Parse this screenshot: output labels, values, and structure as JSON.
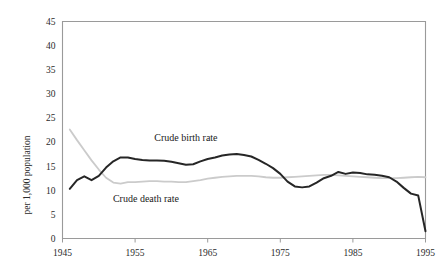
{
  "chart_data": {
    "type": "line",
    "title": "",
    "xlabel": "",
    "ylabel": "per 1,000 population",
    "xlim": [
      1945,
      1995
    ],
    "ylim": [
      0,
      45
    ],
    "ytick_labels": [
      "0",
      "5",
      "10",
      "15",
      "20",
      "25",
      "30",
      "35",
      "40",
      "45"
    ],
    "ytick_values": [
      0,
      5,
      10,
      15,
      20,
      25,
      30,
      35,
      40,
      45
    ],
    "xtick_labels": [
      "1945",
      "1955",
      "1965",
      "1975",
      "1985",
      "1995"
    ],
    "xtick_values": [
      1945,
      1955,
      1965,
      1975,
      1985,
      1995
    ],
    "grid": false,
    "legend_position": "inline-annotation",
    "annotations": [
      {
        "text": "Crude birth rate",
        "x": 1962,
        "y": 20.2
      },
      {
        "text": "Crude death rate",
        "x": 1956.5,
        "y": 7.6
      }
    ],
    "series": [
      {
        "name": "Crude birth rate",
        "color": "#262626",
        "width": 2.0,
        "x": [
          1946,
          1947,
          1948,
          1949,
          1950,
          1951,
          1952,
          1953,
          1954,
          1955,
          1956,
          1957,
          1958,
          1959,
          1960,
          1961,
          1962,
          1963,
          1964,
          1965,
          1966,
          1967,
          1968,
          1969,
          1970,
          1971,
          1972,
          1973,
          1974,
          1975,
          1976,
          1977,
          1978,
          1979,
          1980,
          1981,
          1982,
          1983,
          1984,
          1985,
          1986,
          1987,
          1988,
          1989,
          1990,
          1991,
          1992,
          1993,
          1994,
          1995
        ],
        "values": [
          10.3,
          12.1,
          12.9,
          12.1,
          13.0,
          14.7,
          16.0,
          16.8,
          16.8,
          16.5,
          16.3,
          16.2,
          16.2,
          16.1,
          15.9,
          15.6,
          15.3,
          15.4,
          16.0,
          16.5,
          16.8,
          17.2,
          17.4,
          17.5,
          17.3,
          17.0,
          16.3,
          15.5,
          14.6,
          13.4,
          11.8,
          10.8,
          10.6,
          10.8,
          11.6,
          12.5,
          13.0,
          13.8,
          13.4,
          13.7,
          13.6,
          13.3,
          13.2,
          13.0,
          12.7,
          11.8,
          10.5,
          9.3,
          8.9,
          1.5
        ]
      },
      {
        "name": "Crude death rate",
        "color": "#cbcbcb",
        "width": 1.8,
        "x": [
          1946,
          1947,
          1948,
          1949,
          1950,
          1951,
          1952,
          1953,
          1954,
          1955,
          1956,
          1957,
          1958,
          1959,
          1960,
          1961,
          1962,
          1963,
          1964,
          1965,
          1966,
          1967,
          1968,
          1969,
          1970,
          1971,
          1972,
          1973,
          1974,
          1975,
          1976,
          1977,
          1978,
          1979,
          1980,
          1981,
          1982,
          1983,
          1984,
          1985,
          1986,
          1987,
          1988,
          1989,
          1990,
          1991,
          1992,
          1993,
          1994,
          1995
        ],
        "values": [
          22.6,
          20.4,
          18.3,
          16.2,
          14.3,
          12.6,
          11.6,
          11.4,
          11.7,
          11.7,
          11.8,
          11.9,
          11.9,
          11.8,
          11.8,
          11.7,
          11.7,
          11.9,
          12.1,
          12.4,
          12.6,
          12.8,
          12.9,
          13.0,
          13.0,
          13.0,
          12.9,
          12.7,
          12.6,
          12.6,
          12.7,
          12.8,
          12.9,
          13.0,
          13.1,
          13.2,
          13.2,
          13.1,
          13.0,
          12.9,
          12.8,
          12.7,
          12.6,
          12.5,
          12.5,
          12.5,
          12.6,
          12.7,
          12.8,
          12.7
        ]
      }
    ]
  }
}
